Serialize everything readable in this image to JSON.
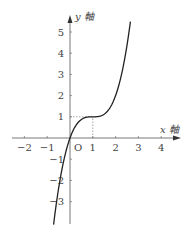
{
  "chart_data": {
    "type": "line",
    "title": "",
    "xlabel": "x 軸",
    "ylabel": "y 軸",
    "origin_label": "O",
    "x_ticks": [
      -2,
      -1,
      1,
      2,
      3,
      4
    ],
    "y_ticks": [
      -3,
      -2,
      -1,
      1,
      2,
      3,
      4,
      5
    ],
    "xlim": [
      -2.6,
      4.6
    ],
    "ylim": [
      -3.8,
      5.8
    ],
    "grid": false,
    "function": "y = (x-1)^3 + 1",
    "series": [
      {
        "name": "curve",
        "x": [
          -0.72,
          -0.5,
          -0.25,
          0,
          0.25,
          0.5,
          0.75,
          1,
          1.25,
          1.5,
          1.75,
          2,
          2.25,
          2.4,
          2.65
        ],
        "y": [
          -4.1,
          -2.375,
          -0.95,
          0,
          0.58,
          0.875,
          0.98,
          1,
          1.02,
          1.125,
          1.42,
          2,
          2.95,
          3.74,
          5.49
        ]
      }
    ],
    "annotations": [
      {
        "type": "dashed",
        "from": [
          0,
          1
        ],
        "to": [
          1,
          1
        ]
      },
      {
        "type": "dashed",
        "from": [
          1,
          0
        ],
        "to": [
          1,
          1
        ]
      }
    ]
  }
}
